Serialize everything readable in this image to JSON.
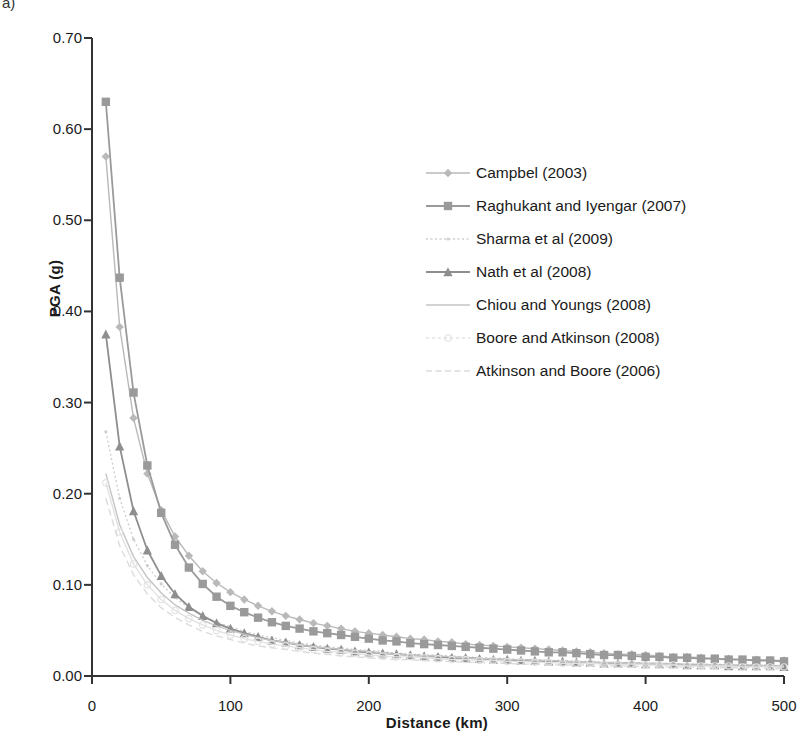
{
  "figure_label": "a)",
  "axes": {
    "ylabel": "PGA (g)",
    "xlabel": "Distance (km)",
    "yticks": [
      "0.00",
      "0.10",
      "0.20",
      "0.30",
      "0.40",
      "0.50",
      "0.60",
      "0.70"
    ],
    "xticks": [
      "0",
      "100",
      "200",
      "300",
      "400",
      "500"
    ]
  },
  "legend": {
    "items": [
      {
        "label": "Campbel (2003)",
        "marker": "diamond",
        "color": "#b9b9b9"
      },
      {
        "label": "Raghukant and Iyengar (2007)",
        "marker": "square",
        "color": "#9a9a9a"
      },
      {
        "label": "Sharma et al (2009)",
        "marker": "none-dotted",
        "color": "#cfcfcf"
      },
      {
        "label": "Nath et al (2008)",
        "marker": "triangle",
        "color": "#8e8e8e"
      },
      {
        "label": "Chiou and Youngs (2008)",
        "marker": "none-line",
        "color": "#c4c4c4"
      },
      {
        "label": "Boore and Atkinson (2008)",
        "marker": "circle-faint",
        "color": "#e2e2e2"
      },
      {
        "label": "Atkinson and Boore (2006)",
        "marker": "none-dashed",
        "color": "#dcdcdc"
      }
    ]
  },
  "chart_data": {
    "type": "line",
    "title": "",
    "xlabel": "Distance (km)",
    "ylabel": "PGA (g)",
    "xlim": [
      0,
      500
    ],
    "ylim": [
      0,
      0.7
    ],
    "ytick_step": 0.1,
    "xtick_step": 100,
    "grid": false,
    "legend_position": "inside-upper-right",
    "x": [
      10,
      20,
      30,
      40,
      50,
      60,
      70,
      80,
      90,
      100,
      110,
      120,
      130,
      140,
      150,
      160,
      170,
      180,
      190,
      200,
      210,
      220,
      230,
      240,
      250,
      260,
      270,
      280,
      290,
      300,
      310,
      320,
      330,
      340,
      350,
      360,
      370,
      380,
      390,
      400,
      410,
      420,
      430,
      440,
      450,
      460,
      470,
      480,
      490,
      500
    ],
    "series": [
      {
        "name": "Campbel (2003)",
        "marker": "diamond",
        "color": "#b9b9b9",
        "values": [
          0.57,
          0.383,
          0.283,
          0.222,
          0.182,
          0.153,
          0.132,
          0.115,
          0.102,
          0.092,
          0.084,
          0.077,
          0.071,
          0.066,
          0.062,
          0.058,
          0.055,
          0.052,
          0.049,
          0.047,
          0.045,
          0.043,
          0.041,
          0.04,
          0.038,
          0.037,
          0.035,
          0.034,
          0.033,
          0.032,
          0.031,
          0.03,
          0.029,
          0.028,
          0.027,
          0.026,
          0.025,
          0.024,
          0.024,
          0.023,
          0.022,
          0.021,
          0.021,
          0.02,
          0.019,
          0.019,
          0.018,
          0.018,
          0.017,
          0.017
        ]
      },
      {
        "name": "Raghukant and Iyengar (2007)",
        "marker": "square",
        "color": "#9a9a9a",
        "values": [
          0.63,
          0.437,
          0.311,
          0.231,
          0.179,
          0.144,
          0.119,
          0.101,
          0.087,
          0.077,
          0.07,
          0.064,
          0.059,
          0.055,
          0.052,
          0.049,
          0.047,
          0.045,
          0.043,
          0.041,
          0.039,
          0.038,
          0.036,
          0.035,
          0.034,
          0.033,
          0.032,
          0.031,
          0.03,
          0.029,
          0.028,
          0.027,
          0.026,
          0.026,
          0.025,
          0.024,
          0.023,
          0.023,
          0.022,
          0.021,
          0.021,
          0.02,
          0.02,
          0.019,
          0.019,
          0.018,
          0.018,
          0.017,
          0.017,
          0.016
        ]
      },
      {
        "name": "Sharma et al (2009)",
        "marker": "none-dotted",
        "color": "#cfcfcf",
        "values": [
          0.268,
          0.195,
          0.15,
          0.121,
          0.101,
          0.086,
          0.075,
          0.066,
          0.059,
          0.054,
          0.049,
          0.045,
          0.042,
          0.039,
          0.036,
          0.034,
          0.032,
          0.031,
          0.029,
          0.028,
          0.027,
          0.025,
          0.024,
          0.023,
          0.023,
          0.022,
          0.021,
          0.02,
          0.02,
          0.019,
          0.018,
          0.018,
          0.017,
          0.017,
          0.016,
          0.016,
          0.015,
          0.015,
          0.015,
          0.014,
          0.014,
          0.014,
          0.013,
          0.013,
          0.013,
          0.012,
          0.012,
          0.012,
          0.012,
          0.011
        ]
      },
      {
        "name": "Nath et al (2008)",
        "marker": "triangle",
        "color": "#8e8e8e",
        "values": [
          0.375,
          0.252,
          0.181,
          0.138,
          0.11,
          0.09,
          0.076,
          0.066,
          0.058,
          0.052,
          0.047,
          0.043,
          0.039,
          0.037,
          0.034,
          0.032,
          0.03,
          0.029,
          0.027,
          0.026,
          0.025,
          0.024,
          0.023,
          0.022,
          0.021,
          0.02,
          0.02,
          0.019,
          0.018,
          0.018,
          0.017,
          0.017,
          0.016,
          0.016,
          0.015,
          0.015,
          0.014,
          0.014,
          0.014,
          0.013,
          0.013,
          0.013,
          0.012,
          0.012,
          0.012,
          0.011,
          0.011,
          0.011,
          0.011,
          0.01
        ]
      },
      {
        "name": "Chiou and Youngs (2008)",
        "marker": "none-line",
        "color": "#c4c4c4",
        "values": [
          0.222,
          0.166,
          0.131,
          0.108,
          0.091,
          0.078,
          0.069,
          0.061,
          0.055,
          0.05,
          0.046,
          0.042,
          0.039,
          0.037,
          0.034,
          0.032,
          0.031,
          0.029,
          0.028,
          0.027,
          0.025,
          0.024,
          0.023,
          0.022,
          0.022,
          0.021,
          0.02,
          0.019,
          0.019,
          0.018,
          0.018,
          0.017,
          0.017,
          0.016,
          0.016,
          0.015,
          0.015,
          0.015,
          0.014,
          0.014,
          0.014,
          0.013,
          0.013,
          0.013,
          0.012,
          0.012,
          0.012,
          0.012,
          0.011,
          0.011
        ]
      },
      {
        "name": "Boore and Atkinson (2008)",
        "marker": "circle-faint",
        "color": "#e2e2e2",
        "values": [
          0.212,
          0.158,
          0.123,
          0.1,
          0.084,
          0.072,
          0.063,
          0.056,
          0.05,
          0.045,
          0.041,
          0.038,
          0.035,
          0.033,
          0.031,
          0.029,
          0.027,
          0.026,
          0.025,
          0.023,
          0.022,
          0.021,
          0.021,
          0.02,
          0.019,
          0.018,
          0.018,
          0.017,
          0.017,
          0.016,
          0.016,
          0.015,
          0.015,
          0.014,
          0.014,
          0.014,
          0.013,
          0.013,
          0.013,
          0.012,
          0.012,
          0.012,
          0.011,
          0.011,
          0.011,
          0.011,
          0.01,
          0.01,
          0.01,
          0.01
        ]
      },
      {
        "name": "Atkinson and Boore (2006)",
        "marker": "none-dashed",
        "color": "#dcdcdc",
        "values": [
          0.195,
          0.143,
          0.111,
          0.09,
          0.075,
          0.064,
          0.056,
          0.049,
          0.044,
          0.04,
          0.036,
          0.033,
          0.031,
          0.029,
          0.027,
          0.025,
          0.024,
          0.022,
          0.021,
          0.02,
          0.019,
          0.018,
          0.018,
          0.017,
          0.016,
          0.016,
          0.015,
          0.015,
          0.014,
          0.014,
          0.013,
          0.013,
          0.013,
          0.012,
          0.012,
          0.012,
          0.011,
          0.011,
          0.011,
          0.01,
          0.01,
          0.01,
          0.01,
          0.009,
          0.009,
          0.009,
          0.009,
          0.009,
          0.008,
          0.008
        ]
      }
    ]
  }
}
